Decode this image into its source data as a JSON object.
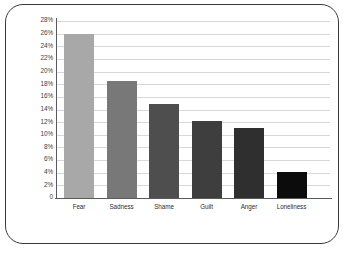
{
  "chart_data": {
    "type": "bar",
    "title": "",
    "subtitle": "",
    "xlabel": "",
    "ylabel": "",
    "categories": [
      "Fear",
      "Sadness",
      "Shame",
      "Guilt",
      "Anger",
      "Loneliness"
    ],
    "values": [
      26.0,
      18.5,
      14.8,
      12.2,
      11.0,
      4.1
    ],
    "value_labels": [
      "26%",
      "18.5%",
      "14.8%",
      "12.2%",
      "11%",
      "4.1%"
    ],
    "series": [
      {
        "name": "Percentage",
        "values": [
          26.0,
          18.5,
          14.8,
          12.2,
          11.0,
          4.1
        ]
      }
    ],
    "ylim": [
      0,
      28
    ],
    "ytick_values": [
      28,
      26,
      24,
      22,
      20,
      18,
      16,
      14,
      12,
      10,
      8,
      6,
      4,
      2,
      0
    ],
    "ytick_labels": [
      "28%",
      "26%",
      "24%",
      "22%",
      "20%",
      "18%",
      "16%",
      "14%",
      "12%",
      "10%",
      "8%",
      "6%",
      "4%",
      "2%",
      "0"
    ],
    "grid": true,
    "grid_orientation": "horizontal",
    "legend": false,
    "legend_position": "none",
    "bar_colors": [
      "#a8a8a8",
      "#787878",
      "#4e4e4e",
      "#3e3e3e",
      "#2f2f2f",
      "#0c0c0c"
    ],
    "annotations": []
  },
  "style": {
    "background": "#ffffff",
    "frame_border_color": "#3a3a3e",
    "gridline_color": "#d8d8dc",
    "axis_color": "#5a5a5e",
    "tick_text_color": "#3d3d41",
    "label_text_color": "#2e2e32"
  }
}
